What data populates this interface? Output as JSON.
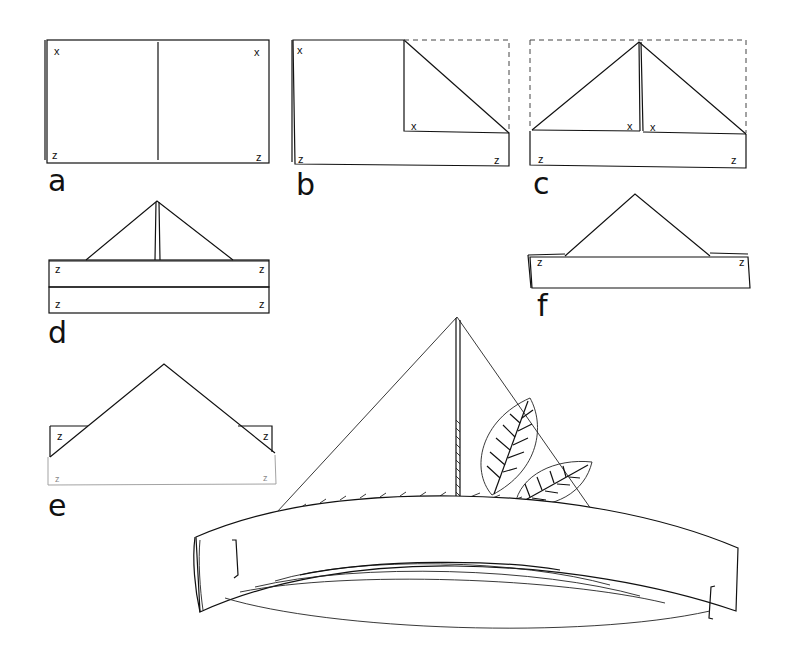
{
  "figure": {
    "step_labels": [
      "a",
      "b",
      "c",
      "d",
      "e",
      "f"
    ],
    "corner_marks": {
      "top": "x",
      "bottom": "z"
    },
    "steps": [
      {
        "id": "a",
        "label": "a",
        "marks": [
          "x",
          "x",
          "z",
          "z"
        ]
      },
      {
        "id": "b",
        "label": "b",
        "marks": [
          "x",
          "x",
          "z",
          "z"
        ]
      },
      {
        "id": "c",
        "label": "c",
        "marks": [
          "x",
          "x",
          "z",
          "z"
        ]
      },
      {
        "id": "d",
        "label": "d",
        "marks": [
          "z",
          "z",
          "z",
          "z"
        ]
      },
      {
        "id": "e",
        "label": "e",
        "marks": [
          "z",
          "z",
          "z",
          "z"
        ]
      },
      {
        "id": "f",
        "label": "f",
        "marks": [
          "z",
          "z"
        ]
      }
    ],
    "final": {
      "description": "finished hat with two leaves tucked in"
    },
    "colors": {
      "line": "#111111",
      "background": "#ffffff"
    }
  }
}
